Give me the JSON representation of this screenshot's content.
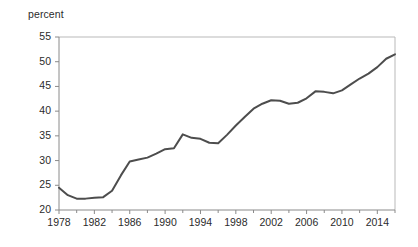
{
  "chart_data": {
    "type": "line",
    "title": "",
    "subtitle": "",
    "xlabel": "",
    "ylabel": "percent",
    "ylabel_position": "top-left",
    "grid": false,
    "legend": null,
    "line_color": "#4d4d4d",
    "frame_color": "#b9b9b9",
    "axis_color": "#8a8a8a",
    "text_color": "#2b2b2b",
    "xlim": [
      1978,
      2016
    ],
    "ylim": [
      20,
      55
    ],
    "ytick_values": [
      20,
      25,
      30,
      35,
      40,
      45,
      50,
      55
    ],
    "ytick_labels": [
      "20",
      "25",
      "30",
      "35",
      "40",
      "45",
      "50",
      "55"
    ],
    "xtick_values": [
      1978,
      1982,
      1986,
      1990,
      1994,
      1998,
      2002,
      2006,
      2010,
      2014
    ],
    "xtick_labels": [
      "1978",
      "1982",
      "1986",
      "1990",
      "1994",
      "1998",
      "2002",
      "2006",
      "2010",
      "2014"
    ],
    "xminor_tick_values": [
      1980,
      1984,
      1988,
      1992,
      1996,
      2000,
      2004,
      2008,
      2012,
      2016
    ],
    "x": [
      1978,
      1979,
      1980,
      1981,
      1982,
      1983,
      1984,
      1985,
      1986,
      1987,
      1988,
      1989,
      1990,
      1991,
      1992,
      1993,
      1994,
      1995,
      1996,
      1997,
      1998,
      1999,
      2000,
      2001,
      2002,
      2003,
      2004,
      2005,
      2006,
      2007,
      2008,
      2009,
      2010,
      2011,
      2012,
      2013,
      2014,
      2015,
      2016
    ],
    "values": [
      24.5,
      23.0,
      22.3,
      22.3,
      22.5,
      22.6,
      23.9,
      27.0,
      29.8,
      30.2,
      30.6,
      31.4,
      32.3,
      32.5,
      35.3,
      34.6,
      34.4,
      33.6,
      33.5,
      35.2,
      37.1,
      38.8,
      40.5,
      41.5,
      42.2,
      42.1,
      41.5,
      41.7,
      42.6,
      44.0,
      43.9,
      43.6,
      44.2,
      45.4,
      46.6,
      47.6,
      48.9,
      50.6,
      51.5
    ],
    "series_name": "percent"
  }
}
